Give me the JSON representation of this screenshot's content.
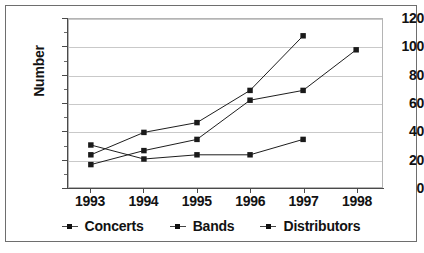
{
  "chart_data": {
    "type": "line",
    "title": "",
    "xlabel": "",
    "ylabel": "Number",
    "categories": [
      "1993",
      "1994",
      "1995",
      "1996",
      "1997",
      "1998"
    ],
    "ylim": [
      0,
      120
    ],
    "ytick_step": 20,
    "yticks": [
      "0",
      "20",
      "40",
      "60",
      "80",
      "100",
      "120"
    ],
    "minor_tick_step": 10,
    "grid": true,
    "grid_axis": "y",
    "legend_position": "bottom",
    "marker": "square",
    "series": [
      {
        "name": "Concerts",
        "color": "#1a1a1a",
        "x": [
          "1993",
          "1994",
          "1995",
          "1996",
          "1997"
        ],
        "values": [
          23,
          39,
          46,
          69,
          108
        ]
      },
      {
        "name": "Bands",
        "color": "#1a1a1a",
        "x": [
          "1993",
          "1994",
          "1995",
          "1996",
          "1997",
          "1998"
        ],
        "values": [
          16,
          26,
          34,
          62,
          69,
          98
        ]
      },
      {
        "name": "Distributors",
        "color": "#1a1a1a",
        "x": [
          "1993",
          "1994",
          "1995",
          "1996",
          "1997"
        ],
        "values": [
          30,
          20,
          23,
          23,
          34
        ]
      }
    ]
  },
  "legend": {
    "items": [
      {
        "label": "Concerts"
      },
      {
        "label": "Bands"
      },
      {
        "label": "Distributors"
      }
    ]
  },
  "axes": {
    "y_title": "Number"
  }
}
